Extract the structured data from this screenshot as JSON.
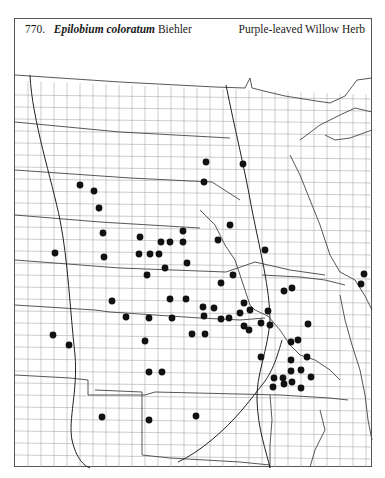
{
  "header": {
    "species_number": "770.",
    "scientific_name": "Epilobium coloratum",
    "author": "Biehler",
    "common_name": "Purple-leaved Willow Herb"
  },
  "map": {
    "type": "county distribution dot map",
    "region": "Great Plains / Upper Midwest, USA",
    "dot_color": "#111111",
    "line_color": "#6a6a6a",
    "record_count": 71,
    "records": [
      [
        80,
        185
      ],
      [
        94,
        191
      ],
      [
        99,
        208
      ],
      [
        103,
        233
      ],
      [
        104,
        257
      ],
      [
        55,
        253
      ],
      [
        206,
        162
      ],
      [
        243,
        164
      ],
      [
        204,
        182
      ],
      [
        230,
        225
      ],
      [
        183,
        231
      ],
      [
        140,
        237
      ],
      [
        161,
        242
      ],
      [
        170,
        242
      ],
      [
        183,
        242
      ],
      [
        218,
        240
      ],
      [
        265,
        250
      ],
      [
        139,
        254
      ],
      [
        150,
        254
      ],
      [
        159,
        254
      ],
      [
        165,
        268
      ],
      [
        187,
        263
      ],
      [
        147,
        275
      ],
      [
        233,
        275
      ],
      [
        364,
        274
      ],
      [
        361,
        284
      ],
      [
        284,
        291
      ],
      [
        292,
        288
      ],
      [
        221,
        283
      ],
      [
        170,
        299
      ],
      [
        186,
        299
      ],
      [
        112,
        301
      ],
      [
        126,
        317
      ],
      [
        149,
        318
      ],
      [
        172,
        318
      ],
      [
        203,
        307
      ],
      [
        214,
        308
      ],
      [
        204,
        316
      ],
      [
        221,
        319
      ],
      [
        229,
        318
      ],
      [
        240,
        313
      ],
      [
        244,
        303
      ],
      [
        250,
        310
      ],
      [
        244,
        326
      ],
      [
        249,
        330
      ],
      [
        261,
        323
      ],
      [
        270,
        325
      ],
      [
        268,
        311
      ],
      [
        192,
        334
      ],
      [
        205,
        334
      ],
      [
        308,
        324
      ],
      [
        145,
        341
      ],
      [
        53,
        335
      ],
      [
        69,
        345
      ],
      [
        291,
        342
      ],
      [
        298,
        340
      ],
      [
        261,
        357
      ],
      [
        291,
        360
      ],
      [
        307,
        357
      ],
      [
        291,
        371
      ],
      [
        301,
        370
      ],
      [
        149,
        372
      ],
      [
        162,
        372
      ],
      [
        274,
        378
      ],
      [
        283,
        378
      ],
      [
        311,
        377
      ],
      [
        273,
        387
      ],
      [
        284,
        384
      ],
      [
        292,
        382
      ],
      [
        301,
        388
      ],
      [
        102,
        417
      ],
      [
        149,
        420
      ],
      [
        196,
        416
      ]
    ]
  }
}
